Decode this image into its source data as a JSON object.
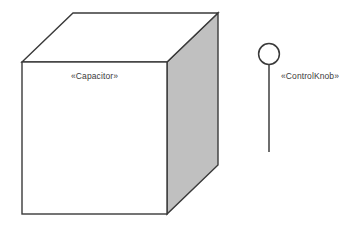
{
  "diagram": {
    "type": "uml-deployment-diagram",
    "background_color": "#ffffff",
    "stroke_color": "#3a3a3a",
    "node": {
      "name": "capacitor-node",
      "label": "«Capacitor»",
      "shape": "3d-box",
      "front_face_color": "#ffffff",
      "side_face_color": "#c0c0c0",
      "top_face_color": "#ffffff",
      "geometry": {
        "front_left": 22,
        "front_top": 62,
        "front_right": 167,
        "front_bottom": 214,
        "depth_dx": 51,
        "depth_dy": -49
      }
    },
    "interface": {
      "name": "controlknob-interface",
      "label": "«ControlKnob»",
      "shape": "lollipop",
      "ball_fill": "#ffffff",
      "geometry": {
        "circle_cx": 269,
        "circle_cy": 54,
        "circle_r": 10.5,
        "stem_x": 269,
        "stem_y1": 64.5,
        "stem_y2": 152
      }
    }
  }
}
